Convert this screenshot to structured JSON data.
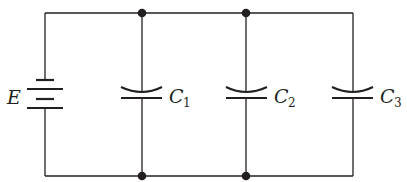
{
  "diagram": {
    "type": "circuit",
    "stroke_color": "#231f20",
    "background": "#ffffff",
    "source": {
      "label": "E",
      "symbol": "battery"
    },
    "components": [
      {
        "id": "C1",
        "label": "C",
        "subscript": "1",
        "symbol": "capacitor"
      },
      {
        "id": "C2",
        "label": "C",
        "subscript": "2",
        "symbol": "capacitor"
      },
      {
        "id": "C3",
        "label": "C",
        "subscript": "3",
        "symbol": "capacitor"
      }
    ],
    "junctions": 4,
    "topology": "parallel"
  }
}
